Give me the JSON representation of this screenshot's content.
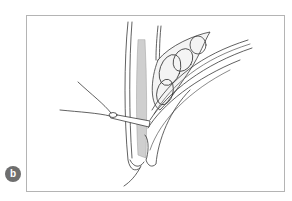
{
  "figure": {
    "panel_label": "b",
    "badge_color": "#6e6e6e",
    "frame_border_color": "#b4b4b4",
    "illustration": "anatomical-line-drawing"
  }
}
